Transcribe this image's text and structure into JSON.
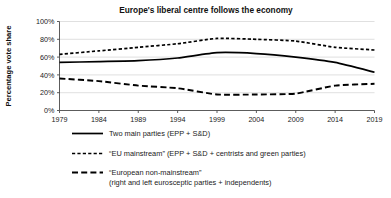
{
  "chart_data": {
    "type": "line",
    "title": "Europe's liberal centre follows the economy",
    "xlabel": "",
    "ylabel": "Percentage vote share",
    "x": [
      1979,
      1984,
      1989,
      1994,
      1999,
      2004,
      2009,
      2014,
      2019
    ],
    "xtick_labels": [
      "1979",
      "1984",
      "1989",
      "1994",
      "1999",
      "2004",
      "2009",
      "2014",
      "2019"
    ],
    "ytick_labels": [
      "0%",
      "20%",
      "40%",
      "60%",
      "80%",
      "100%"
    ],
    "ytick_values": [
      0,
      20,
      40,
      60,
      80,
      100
    ],
    "ylim": [
      0,
      100
    ],
    "xlim": [
      1979,
      2019
    ],
    "grid": true,
    "legend_position": "below",
    "series": [
      {
        "name": "Two main parties (EPP + S&D)",
        "style": "solid",
        "color": "#000000",
        "values": [
          54,
          55,
          56,
          59,
          65,
          64,
          60,
          54,
          43
        ]
      },
      {
        "name": "“EU mainstream” (EPP + S&D + centrists and green parties)",
        "style": "short-dash",
        "color": "#000000",
        "values": [
          63,
          67,
          71,
          75,
          81,
          80,
          78,
          71,
          68
        ]
      },
      {
        "name": "“European non-mainstream” (right and left eurosceptic parties + independents)",
        "style": "long-dash",
        "color": "#000000",
        "values": [
          36,
          33,
          28,
          25,
          18,
          18,
          19,
          28,
          30
        ]
      }
    ]
  },
  "legend": {
    "entries": [
      {
        "style": "solid",
        "line1": "Two main parties (EPP + S&D)",
        "line2": ""
      },
      {
        "style": "short-dash",
        "line1": "“EU mainstream” (EPP + S&D + centrists and green parties)",
        "line2": ""
      },
      {
        "style": "long-dash",
        "line1": "“European non-mainstream”",
        "line2": "(right and left eurosceptic parties + independents)"
      }
    ]
  }
}
